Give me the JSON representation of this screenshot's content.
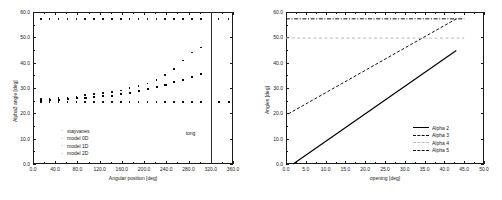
{
  "figure": {
    "background": "#ffffff",
    "axis_color": "#1a1a1a",
    "panel_count": 2
  },
  "chart_data": [
    {
      "type": "scatter",
      "title": "",
      "xlabel": "Angular position [deg]",
      "ylabel": "Alpha3 angle [deg]",
      "xlim": [
        0.0,
        360.0
      ],
      "ylim": [
        0.0,
        60.0
      ],
      "xticks": [
        "0.0",
        "40.0",
        "80.0",
        "120.0",
        "160.0",
        "200.0",
        "240.0",
        "280.0",
        "320.0",
        "360.0"
      ],
      "yticks": [
        "0.0",
        "10.0",
        "20.0",
        "30.0",
        "40.0",
        "50.0",
        "60.0"
      ],
      "xtick_values": [
        0,
        40,
        80,
        120,
        160,
        200,
        240,
        280,
        320,
        360
      ],
      "ytick_values": [
        0,
        10,
        20,
        30,
        40,
        50,
        60
      ],
      "grid": false,
      "legend_position": "lower-left",
      "legend": [
        "stayvanes",
        "model 0D",
        "model 1D",
        "model 2D"
      ],
      "annotations": [
        {
          "text": "tong",
          "x": 300,
          "y": 13.5
        }
      ],
      "vertical_line_x": 320,
      "series": [
        {
          "name": "stayvanes",
          "marker": "dot",
          "x": [
            14,
            30,
            46,
            62,
            78,
            94,
            110,
            126,
            142,
            158,
            174,
            190,
            206,
            222,
            238,
            254,
            270,
            286,
            302,
            334,
            352
          ],
          "y": [
            57.3,
            57.3,
            57.3,
            57.3,
            57.3,
            57.3,
            57.3,
            57.3,
            57.3,
            57.3,
            57.3,
            57.3,
            57.3,
            57.3,
            57.3,
            57.3,
            57.3,
            57.3,
            57.3,
            57.3,
            57.3
          ]
        },
        {
          "name": "model 0D",
          "marker": "dot",
          "x": [
            14,
            30,
            46,
            62,
            78,
            94,
            110,
            126,
            142,
            158,
            174,
            190,
            206,
            222,
            238,
            254,
            270,
            286,
            302,
            334,
            352
          ],
          "y": [
            24.4,
            24.4,
            24.4,
            24.4,
            24.4,
            24.4,
            24.4,
            24.4,
            24.4,
            24.4,
            24.4,
            24.4,
            24.4,
            24.4,
            24.4,
            24.4,
            24.4,
            24.4,
            24.4,
            24.2,
            24.2
          ]
        },
        {
          "name": "model 1D",
          "marker": "dot",
          "x": [
            14,
            30,
            46,
            62,
            78,
            94,
            110,
            126,
            142,
            158,
            174,
            190,
            206,
            222,
            238,
            254,
            270,
            286,
            302,
            334,
            352
          ],
          "y": [
            25.1,
            25.2,
            25.5,
            25.6,
            26.0,
            26.2,
            26.5,
            26.8,
            27.1,
            27.6,
            28.3,
            29.0,
            29.6,
            30.5,
            31.4,
            32.3,
            33.4,
            34.6,
            35.7,
            24.6,
            24.6
          ]
        },
        {
          "name": "model 2D",
          "marker": "dot",
          "x": [
            14,
            30,
            46,
            62,
            78,
            94,
            110,
            126,
            142,
            158,
            174,
            190,
            206,
            222,
            238,
            254,
            270,
            286,
            302
          ],
          "y": [
            25.6,
            25.7,
            26.0,
            26.3,
            26.7,
            27.2,
            27.6,
            28.0,
            28.4,
            29.0,
            29.9,
            30.8,
            31.8,
            33.2,
            35.1,
            37.6,
            40.8,
            44.0,
            46.0
          ]
        }
      ]
    },
    {
      "type": "line",
      "title": "",
      "xlabel": "opening [deg]",
      "ylabel": "Angles [deg]",
      "xlim": [
        0.0,
        50.0
      ],
      "ylim": [
        0.0,
        60.0
      ],
      "xticks": [
        "0.0",
        "5.0",
        "10.0",
        "15.0",
        "20.0",
        "25.0",
        "30.0",
        "35.0",
        "40.0",
        "45.0",
        "50.0"
      ],
      "yticks": [
        "0.0",
        "10.0",
        "20.0",
        "30.0",
        "40.0",
        "50.0",
        "60.0"
      ],
      "xtick_values": [
        0,
        5,
        10,
        15,
        20,
        25,
        30,
        35,
        40,
        45,
        50
      ],
      "ytick_values": [
        0,
        10,
        20,
        30,
        40,
        50,
        60
      ],
      "grid": false,
      "legend_position": "lower-right",
      "series": [
        {
          "name": "Alpha 2",
          "style": "solid",
          "color": "#000000",
          "x": [
            1.8,
            43.0
          ],
          "y": [
            0.0,
            44.8
          ]
        },
        {
          "name": "Alpha 3",
          "style": "dashed",
          "color": "#111111",
          "x": [
            0.6,
            43.0
          ],
          "y": [
            19.8,
            57.3
          ]
        },
        {
          "name": "Alpha 4",
          "style": "light-dashed",
          "color": "#bbbbbb",
          "x": [
            0.0,
            45.0
          ],
          "y": [
            49.7,
            49.7
          ]
        },
        {
          "name": "Alpha 5",
          "style": "dash-dot",
          "color": "#111111",
          "x": [
            0.0,
            45.0
          ],
          "y": [
            57.3,
            57.3
          ]
        }
      ],
      "legend": [
        "Alpha 2",
        "Alpha 3",
        "Alpha 4",
        "Alpha 5"
      ]
    }
  ]
}
